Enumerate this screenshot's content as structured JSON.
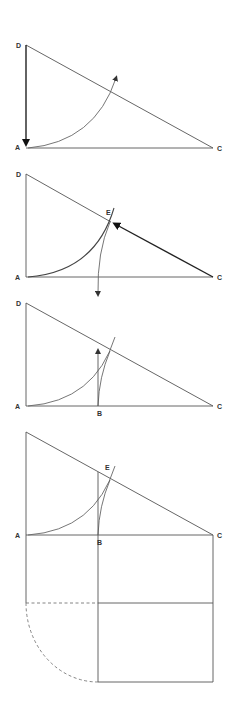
{
  "figure": {
    "panels": [
      {
        "id": "step1",
        "labels": {
          "D": "D",
          "A": "A",
          "C": "C"
        }
      },
      {
        "id": "step2",
        "labels": {
          "D": "D",
          "A": "A",
          "C": "C",
          "E": "E"
        }
      },
      {
        "id": "step3",
        "labels": {
          "D": "D",
          "A": "A",
          "C": "C",
          "B": "B"
        }
      },
      {
        "id": "step4",
        "labels": {
          "A": "A",
          "C": "C",
          "B": "B",
          "E": "E"
        }
      }
    ],
    "colors": {
      "line": "#555555",
      "label": "#333333",
      "background": "#ffffff"
    }
  }
}
